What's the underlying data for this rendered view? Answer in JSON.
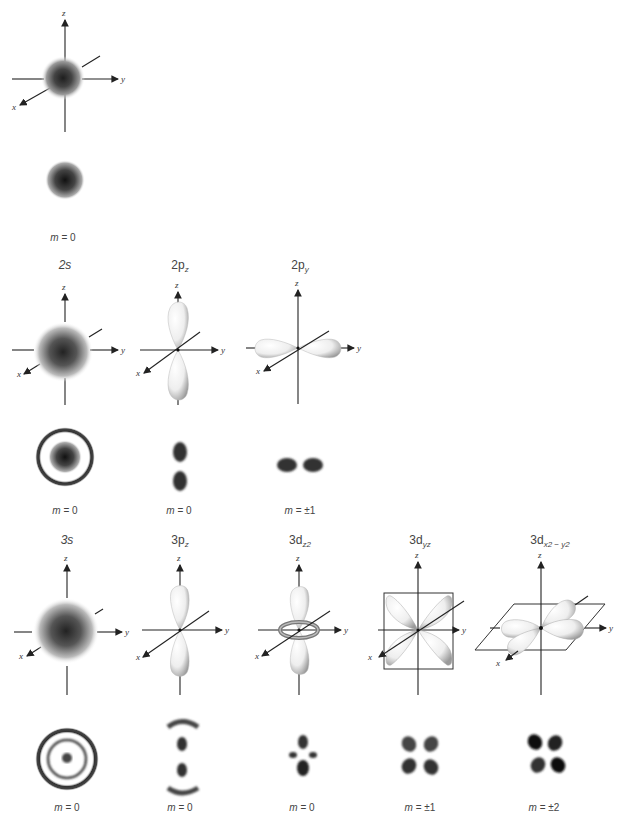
{
  "figure": {
    "axis_labels": {
      "x": "x",
      "y": "y",
      "z": "z"
    },
    "rows": [
      {
        "orbitals": [
          {
            "name": "1s",
            "title_main": "",
            "title_sub": "",
            "m_label_var": "m",
            "m_label_value": "= 0",
            "shape": "sphere"
          }
        ]
      },
      {
        "orbitals": [
          {
            "name": "2s",
            "title_main": "2s",
            "title_sub": "",
            "m_label_var": "m",
            "m_label_value": "= 0",
            "shape": "sphere"
          },
          {
            "name": "2pz",
            "title_main": "2p",
            "title_sub": "z",
            "m_label_var": "m",
            "m_label_value": "= 0",
            "shape": "dumbbell-z"
          },
          {
            "name": "2py",
            "title_main": "2p",
            "title_sub": "y",
            "m_label_var": "m",
            "m_label_value": "= ±1",
            "shape": "dumbbell-y"
          }
        ]
      },
      {
        "orbitals": [
          {
            "name": "3s",
            "title_main": "3s",
            "title_sub": "",
            "m_label_var": "m",
            "m_label_value": "= 0",
            "shape": "sphere"
          },
          {
            "name": "3pz",
            "title_main": "3p",
            "title_sub": "z",
            "m_label_var": "m",
            "m_label_value": "= 0",
            "shape": "dumbbell-z"
          },
          {
            "name": "3dz2",
            "title_main": "3d",
            "title_sub": "z2",
            "m_label_var": "m",
            "m_label_value": "= 0",
            "shape": "dumbbell-torus"
          },
          {
            "name": "3dyz",
            "title_main": "3d",
            "title_sub": "yz",
            "m_label_var": "m",
            "m_label_value": "= ±1",
            "shape": "cloverleaf-yz"
          },
          {
            "name": "3dx2-y2",
            "title_main": "3d",
            "title_sub": "x2 − y2",
            "m_label_var": "m",
            "m_label_value": "= ±2",
            "shape": "cloverleaf-xy"
          }
        ]
      }
    ]
  },
  "colors": {
    "ink": "#222222",
    "lobe_fill": "#f2f2f2",
    "lobe_shade": "#9a9a9a",
    "density_dark": "#1a1a1a",
    "background": "#ffffff"
  }
}
